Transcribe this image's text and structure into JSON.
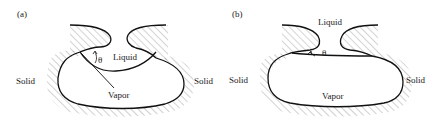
{
  "figure": {
    "panels": [
      {
        "id": "a",
        "label": "(a)",
        "labels": {
          "liquid": "Liquid",
          "vapor": "Vapor",
          "solid_left": "Solid",
          "solid_right": "Solid",
          "angle": "θ"
        },
        "description": "Vapor-filled cavity with curved liquid meniscus penetrating into cavity mouth"
      },
      {
        "id": "b",
        "label": "(b)",
        "labels": {
          "liquid": "Liquid",
          "vapor": "Vapor",
          "solid_left": "Solid",
          "solid_right": "Solid",
          "angle": "θ"
        },
        "description": "Vapor-filled cavity with nearly flat liquid meniscus at cavity mouth"
      }
    ],
    "colors": {
      "line": "#111111",
      "hatch": "#666666",
      "background": "#ffffff"
    }
  }
}
